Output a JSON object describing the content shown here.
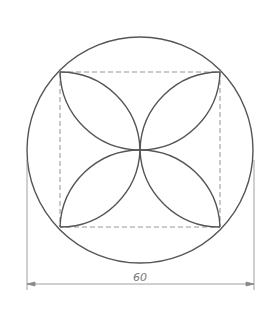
{
  "drawing": {
    "title": "Circle with inscribed square and four-petal arcs",
    "dimension_label": "60",
    "colors": {
      "line": "#555555",
      "dashed": "#888888",
      "dimension": "#888888"
    }
  }
}
